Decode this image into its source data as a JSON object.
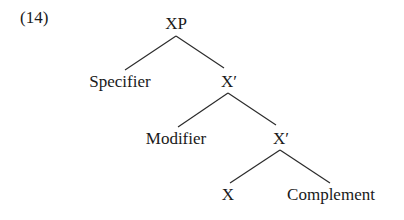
{
  "example_number": "(14)",
  "tree": {
    "nodes": [
      {
        "id": "xp",
        "label": "XP"
      },
      {
        "id": "specifier",
        "label": "Specifier"
      },
      {
        "id": "xbar1",
        "label": "X′"
      },
      {
        "id": "modifier",
        "label": "Modifier"
      },
      {
        "id": "xbar2",
        "label": "X′"
      },
      {
        "id": "x",
        "label": "X"
      },
      {
        "id": "complement",
        "label": "Complement"
      }
    ],
    "edges": [
      [
        "xp",
        "specifier"
      ],
      [
        "xp",
        "xbar1"
      ],
      [
        "xbar1",
        "modifier"
      ],
      [
        "xbar1",
        "xbar2"
      ],
      [
        "xbar2",
        "x"
      ],
      [
        "xbar2",
        "complement"
      ]
    ]
  }
}
